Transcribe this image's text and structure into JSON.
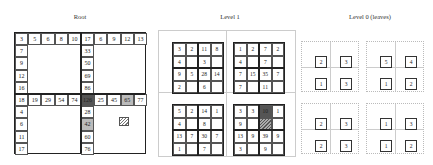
{
  "titles": {
    "root": "Root",
    "level1": "Level 1",
    "level0": "Level 0 (leaves)"
  },
  "root": {
    "top_left_row": [
      "3",
      "5",
      "6",
      "8",
      "10"
    ],
    "top_left_col": [
      "7",
      "9",
      "12",
      "16"
    ],
    "top_right_row": [
      "17",
      "6",
      "9",
      "12",
      "13"
    ],
    "top_right_col": [
      "33",
      "50",
      "69",
      "86"
    ],
    "bottom_left_row": [
      "18",
      "19",
      "29",
      "54",
      "74"
    ],
    "bottom_left_col": [
      "4",
      "6",
      "11",
      "17"
    ],
    "bottom_right_row": [
      "126",
      "25",
      "45",
      "65",
      "77"
    ],
    "bottom_right_col": [
      "28",
      "42",
      "60",
      "76"
    ],
    "highlight": {
      "dark": "126",
      "light": [
        "65",
        "42"
      ]
    }
  },
  "level1": {
    "blocks": [
      [
        "3",
        "2",
        "11",
        "8",
        "4",
        "",
        "3",
        "",
        "9",
        "5",
        "28",
        "14",
        "2",
        "",
        "6",
        ""
      ],
      [
        "1",
        "2",
        "7",
        "2",
        "4",
        "",
        "7",
        "",
        "7",
        "15",
        "35",
        "7",
        "7",
        "",
        "11",
        ""
      ],
      [
        "5",
        "2",
        "14",
        "1",
        "4",
        "",
        "8",
        "",
        "13",
        "7",
        "30",
        "7",
        "1",
        "",
        "7",
        ""
      ],
      [
        "3",
        "3",
        "10",
        "1",
        "9",
        "",
        "",
        "",
        "13",
        "9",
        "39",
        "9",
        "3",
        "",
        "9",
        ""
      ]
    ]
  },
  "level0": {
    "quads": [
      [
        "2",
        "3",
        "1",
        "3"
      ],
      [
        "5",
        "4",
        "1",
        "2"
      ],
      [
        "2",
        "3",
        "2",
        "3"
      ],
      [
        "1",
        "3",
        "1",
        "2"
      ]
    ]
  }
}
